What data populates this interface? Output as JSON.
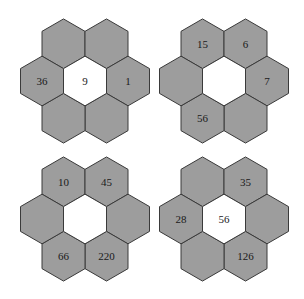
{
  "puzzle": {
    "colors": {
      "outer_fill": "#9d9d9d",
      "center_fill": "#ffffff",
      "stroke": "#3a3a3a",
      "text": "#1a1a1a"
    },
    "clusters": [
      {
        "name": "cluster-top-left",
        "center": {
          "value": "9",
          "cx": 85,
          "cy": 81
        },
        "ring": [
          {
            "pos": "top-left",
            "value": ""
          },
          {
            "pos": "top-right",
            "value": ""
          },
          {
            "pos": "right",
            "value": "1"
          },
          {
            "pos": "bottom-right",
            "value": ""
          },
          {
            "pos": "bottom-left",
            "value": ""
          },
          {
            "pos": "left",
            "value": "36"
          }
        ]
      },
      {
        "name": "cluster-top-right",
        "center": {
          "value": "",
          "cx": 224,
          "cy": 81
        },
        "ring": [
          {
            "pos": "top-left",
            "value": "15"
          },
          {
            "pos": "top-right",
            "value": "6"
          },
          {
            "pos": "right",
            "value": "7"
          },
          {
            "pos": "bottom-right",
            "value": ""
          },
          {
            "pos": "bottom-left",
            "value": "56"
          },
          {
            "pos": "left",
            "value": ""
          }
        ]
      },
      {
        "name": "cluster-bottom-left",
        "center": {
          "value": "",
          "cx": 85,
          "cy": 219
        },
        "ring": [
          {
            "pos": "top-left",
            "value": "10"
          },
          {
            "pos": "top-right",
            "value": "45"
          },
          {
            "pos": "right",
            "value": ""
          },
          {
            "pos": "bottom-right",
            "value": "220"
          },
          {
            "pos": "bottom-left",
            "value": "66"
          },
          {
            "pos": "left",
            "value": ""
          }
        ]
      },
      {
        "name": "cluster-bottom-right",
        "center": {
          "value": "56",
          "cx": 224,
          "cy": 219
        },
        "ring": [
          {
            "pos": "top-left",
            "value": ""
          },
          {
            "pos": "top-right",
            "value": "35"
          },
          {
            "pos": "right",
            "value": ""
          },
          {
            "pos": "bottom-right",
            "value": "126"
          },
          {
            "pos": "bottom-left",
            "value": ""
          },
          {
            "pos": "left",
            "value": "28"
          }
        ]
      }
    ]
  }
}
